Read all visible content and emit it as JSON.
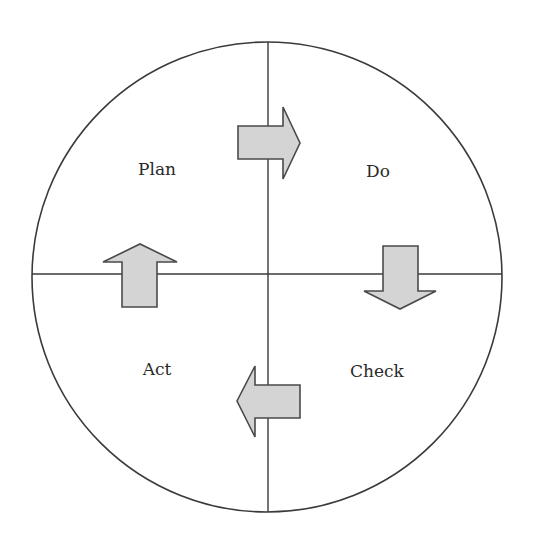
{
  "diagram": {
    "colors": {
      "stroke": "#3a3a3a",
      "arrow_fill": "#d4d4d4",
      "arrow_stroke": "#4a4a4a",
      "text": "#2a2a2a"
    },
    "quadrants": [
      {
        "id": "plan",
        "label": "Plan",
        "position": "top-left"
      },
      {
        "id": "do",
        "label": "Do",
        "position": "top-right"
      },
      {
        "id": "check",
        "label": "Check",
        "position": "bottom-right"
      },
      {
        "id": "act",
        "label": "Act",
        "position": "bottom-left"
      }
    ],
    "arrows": [
      {
        "from": "Plan",
        "to": "Do",
        "direction": "right"
      },
      {
        "from": "Do",
        "to": "Check",
        "direction": "down"
      },
      {
        "from": "Check",
        "to": "Act",
        "direction": "left"
      },
      {
        "from": "Act",
        "to": "Plan",
        "direction": "up"
      }
    ]
  }
}
